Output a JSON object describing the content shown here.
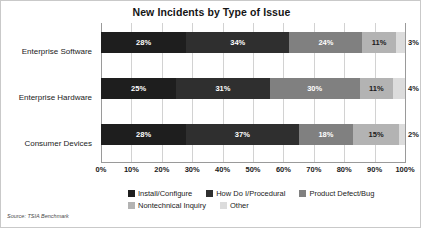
{
  "chart_data": {
    "type": "bar",
    "orientation": "horizontal",
    "stacked": true,
    "stack_mode": "percent",
    "title": "New Incidents by Type of Issue",
    "xlabel": "",
    "ylabel": "",
    "xlim": [
      0,
      100
    ],
    "grid": true,
    "legend_position": "bottom",
    "source_note": "Source: TSIA Benchmark",
    "categories": [
      "Enterprise Software",
      "Enterprise Hardware",
      "Consumer Devices"
    ],
    "xticks": [
      "0%",
      "10%",
      "20%",
      "30%",
      "40%",
      "50%",
      "60%",
      "70%",
      "80%",
      "90%",
      "100%"
    ],
    "xtick_values": [
      0,
      10,
      20,
      30,
      40,
      50,
      60,
      70,
      80,
      90,
      100
    ],
    "series": [
      {
        "name": "Install/Configure",
        "color": "#1e1e1e",
        "label_color": "#ffffff",
        "values": [
          28,
          25,
          28
        ],
        "labels": [
          "28%",
          "25%",
          "28%"
        ]
      },
      {
        "name": "How Do I/Procedural",
        "color": "#2f2f2f",
        "label_color": "#ffffff",
        "values": [
          34,
          31,
          37
        ],
        "labels": [
          "34%",
          "31%",
          "37%"
        ]
      },
      {
        "name": "Product Defect/Bug",
        "color": "#808080",
        "label_color": "#ffffff",
        "values": [
          24,
          30,
          18
        ],
        "labels": [
          "24%",
          "30%",
          "18%"
        ]
      },
      {
        "name": "Nontechnical Inquiry",
        "color": "#b3b3b3",
        "label_color": "#1b1b1b",
        "values": [
          11,
          11,
          15
        ],
        "labels": [
          "11%",
          "11%",
          "15%"
        ]
      },
      {
        "name": "Other",
        "color": "#dcdcdc",
        "label_color": "#1b1b1b",
        "values": [
          3,
          4,
          2
        ],
        "labels": [
          "3%",
          "4%",
          "2%"
        ]
      }
    ]
  },
  "legend_rows": [
    [
      {
        "name": "Install/Configure",
        "color": "#1e1e1e"
      },
      {
        "name": "How Do I/Procedural",
        "color": "#2f2f2f"
      },
      {
        "name": "Product Defect/Bug",
        "color": "#808080"
      }
    ],
    [
      {
        "name": "Nontechnical Inquiry",
        "color": "#b3b3b3"
      },
      {
        "name": "Other",
        "color": "#dcdcdc"
      }
    ]
  ]
}
